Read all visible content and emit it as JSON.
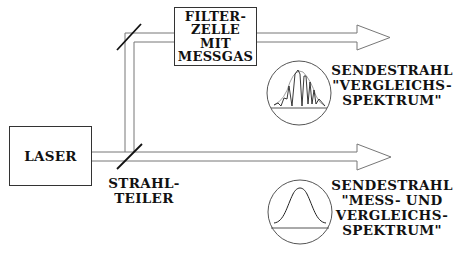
{
  "diagram": {
    "laser": {
      "label": "LASER"
    },
    "filter_cell": {
      "lines": [
        "FILTER-",
        "ZELLE",
        "MIT",
        "MESSGAS"
      ]
    },
    "beam_splitter": {
      "lines": [
        "STRAHL-",
        "TEILER"
      ]
    },
    "upper_output": {
      "lines": [
        "SENDESTRAHL",
        "\"VERGLEICHS-",
        "SPEKTRUM\""
      ],
      "spectrum": "gaussian-with-absorption-lines"
    },
    "lower_output": {
      "lines": [
        "SENDESTRAHL",
        "\"MESS- UND",
        "VERGLEICHS-",
        "SPEKTRUM\""
      ],
      "spectrum": "gaussian"
    },
    "colors": {
      "line": "#333333",
      "beam": "#777777",
      "text": "#111111"
    }
  }
}
